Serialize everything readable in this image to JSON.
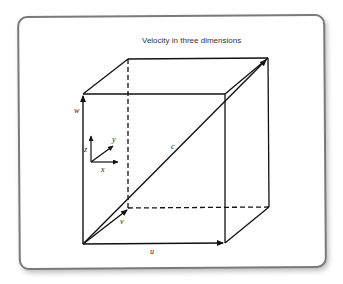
{
  "title": "Velocity in three dimensions",
  "vectors": {
    "u": "u",
    "v": "v",
    "w": "w",
    "c": "c"
  },
  "axes": {
    "x": "x",
    "y": "y",
    "z": "z"
  },
  "colors": {
    "line": "#111111",
    "frame": "#7a7a7a",
    "text": "#333333"
  }
}
